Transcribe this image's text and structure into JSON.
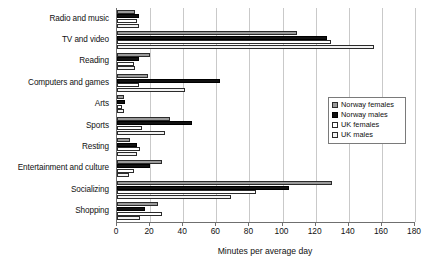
{
  "chart_data": {
    "type": "bar",
    "orientation": "horizontal",
    "title": "",
    "subtitle": "",
    "xlabel": "Minutes per average day",
    "ylabel": "",
    "xlim": [
      0,
      180
    ],
    "xticks": [
      0,
      20,
      40,
      60,
      80,
      100,
      120,
      140,
      160,
      180
    ],
    "grid": true,
    "legend_position": "right-middle",
    "categories": [
      "Radio and music",
      "TV and video",
      "Reading",
      "Computers and games",
      "Arts",
      "Sports",
      "Resting",
      "Entertainment and culture",
      "Socializing",
      "Shopping"
    ],
    "series": [
      {
        "name": "Norway females",
        "color": "#9a9a9a",
        "values": [
          11,
          109,
          20,
          19,
          4,
          32,
          8,
          27,
          130,
          25
        ]
      },
      {
        "name": "Norway males",
        "color": "#111111",
        "values": [
          13,
          127,
          13,
          62,
          5,
          45,
          12,
          20,
          104,
          17
        ]
      },
      {
        "name": "UK females",
        "color": "#ffffff",
        "values": [
          12,
          129,
          10,
          13,
          3,
          15,
          14,
          10,
          84,
          27
        ]
      },
      {
        "name": "UK males",
        "color": "#f2f2f2",
        "values": [
          13,
          155,
          11,
          41,
          4,
          29,
          12,
          7,
          69,
          14
        ]
      }
    ]
  },
  "axis": {
    "x_title": "Minutes per average day"
  },
  "legend": {
    "items": [
      {
        "label": "Norway females",
        "swatch": "gray-swatch"
      },
      {
        "label": "Norway males",
        "swatch": "black-swatch"
      },
      {
        "label": "UK females",
        "swatch": "white-swatch"
      },
      {
        "label": "UK males",
        "swatch": "light-swatch"
      }
    ]
  }
}
